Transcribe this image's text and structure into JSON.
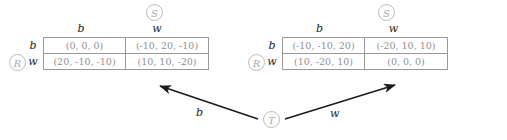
{
  "figure": {
    "type": "extensive-form-game-with-payoff-matrices",
    "players": {
      "row_player": "R",
      "column_player": "S",
      "chance_or_third_player": "T"
    },
    "actions": [
      "b",
      "w"
    ]
  },
  "left_matrix": {
    "branch_label": "b",
    "column_player_label": "S",
    "row_player_label": "R",
    "column_headers": [
      "b",
      "w"
    ],
    "row_headers": [
      "b",
      "w"
    ],
    "cells": [
      [
        "(0, 0, 0)",
        "(-10, 20, -10)"
      ],
      [
        "(20, -10, -10)",
        "(10, 10, -20)"
      ]
    ]
  },
  "right_matrix": {
    "branch_label": "w",
    "column_player_label": "S",
    "row_player_label": "R",
    "column_headers": [
      "b",
      "w"
    ],
    "row_headers": [
      "b",
      "w"
    ],
    "cells": [
      [
        "(-10, -10, 20)",
        "(-20, 10, 10)"
      ],
      [
        "(10, -20, 10)",
        "(0, 0, 0)"
      ]
    ]
  },
  "root_node": {
    "label": "T",
    "left_branch_label": "b",
    "right_branch_label": "w"
  },
  "colors": {
    "node_stroke": "#b9b9b9",
    "node_text": "#a8a8a8",
    "cell_text": "#8f8f8f",
    "cell_border": "#9a9a9a",
    "header_text": "#1d1d1d",
    "arrow": "#1a1a1a",
    "background": "#ffffff"
  }
}
